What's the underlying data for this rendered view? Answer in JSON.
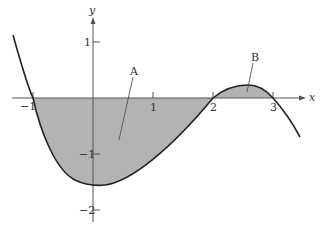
{
  "figure": {
    "axes": {
      "x_label": "x",
      "y_label": "y",
      "x_ticks": [
        {
          "value": -1,
          "label": "−1"
        },
        {
          "value": 1,
          "label": "1"
        },
        {
          "value": 2,
          "label": "2"
        },
        {
          "value": 3,
          "label": "3"
        }
      ],
      "y_ticks": [
        {
          "value": 1,
          "label": "1"
        },
        {
          "value": -1,
          "label": "−1"
        },
        {
          "value": -2,
          "label": "−2"
        }
      ]
    },
    "regions": [
      {
        "name": "A",
        "label": "A",
        "interval": [
          -1,
          2
        ],
        "side": "below x-axis"
      },
      {
        "name": "B",
        "label": "B",
        "interval": [
          2,
          3
        ],
        "side": "above x-axis"
      }
    ],
    "curve": {
      "description": "cubic with roots at x = -1, 2, 3",
      "roots": [
        -1,
        2,
        3
      ],
      "minimum_approx": {
        "x": 0.1,
        "y": -1.55
      },
      "local_max_approx": {
        "x": 2.5,
        "y": 0.22
      }
    },
    "colors": {
      "shade": "#b3b3b3",
      "curve": "#222222",
      "axis": "#555555",
      "background": "#ffffff"
    }
  }
}
